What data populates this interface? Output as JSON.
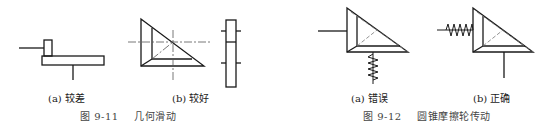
{
  "figures": [
    {
      "id": "fig-9-11",
      "caption_prefix": "图 9-11",
      "caption_title": "几何滑动",
      "subfigures": [
        {
          "tag": "(a)",
          "label": "较差"
        },
        {
          "tag": "(b)",
          "label": "较好"
        }
      ]
    },
    {
      "id": "fig-9-12",
      "caption_prefix": "图 9-12",
      "caption_title": "圆锥摩擦轮传动",
      "subfigures": [
        {
          "tag": "(a)",
          "label": "错误"
        },
        {
          "tag": "(b)",
          "label": "正确"
        }
      ]
    }
  ],
  "colors": {
    "line": "#1a1a1a",
    "centerline": "#555555",
    "background": "#ffffff"
  }
}
